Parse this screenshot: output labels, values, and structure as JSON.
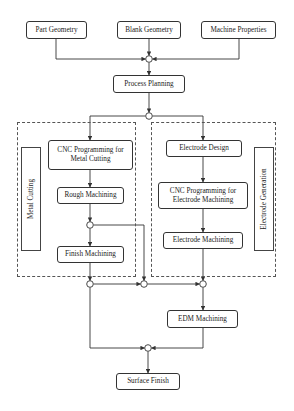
{
  "diagram": {
    "inputs": [
      {
        "id": "part_geometry",
        "label": "Part Geometry"
      },
      {
        "id": "blank_geometry",
        "label": "Blank Geometry"
      },
      {
        "id": "machine_properties",
        "label": "Machine Properties"
      }
    ],
    "process_planning": {
      "label": "Process Planning"
    },
    "metal_cutting": {
      "group_label": "Metal Cutting",
      "steps": [
        {
          "label": "CNC Programming for Metal Cutting"
        },
        {
          "label": "Rough Machining"
        },
        {
          "label": "Finish Machining"
        }
      ]
    },
    "electrode_generation": {
      "group_label": "Electrode Generation",
      "steps": [
        {
          "label": "Electrode Design"
        },
        {
          "label": "CNC Programming for Electrode Machining"
        },
        {
          "label": "Electrode Machining"
        }
      ]
    },
    "edm": {
      "label": "EDM Machining"
    },
    "output": {
      "label": "Surface Finish"
    },
    "colors": {
      "line": "#333333",
      "box_border": "#333333",
      "dashed": "#555555",
      "background": "#ffffff"
    }
  }
}
